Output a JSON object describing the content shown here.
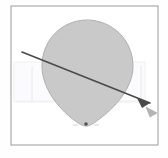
{
  "canvas": {
    "width": 168,
    "height": 158,
    "background_color": "#fefefe",
    "label": "shape-canvas"
  },
  "frame": {
    "label": "canvas-border-frame",
    "x": 11,
    "y": 6,
    "width": 147,
    "height": 139,
    "stroke_color": "#9a9a9a",
    "stroke_width": 1,
    "fill_color": "#ffffff"
  },
  "faint_overlay": {
    "label": "selection-overlay-rect",
    "x": 14,
    "y": 62,
    "width": 131,
    "height": 40,
    "fill_color": "#fbfbfd",
    "stroke_color": "#f0f0f5",
    "stroke_width": 1
  },
  "shape": {
    "label": "teardrop-balloon-shape",
    "type": "teardrop",
    "fill_color": "#c9c9c9",
    "stroke_color": "#b0b0b0",
    "stroke_width": 1,
    "bounds": {
      "left": 42,
      "top": 20,
      "right": 133,
      "bottom": 126
    },
    "center_x": 87,
    "top_y": 20,
    "tip_x": 86,
    "tip_y": 126,
    "path": "M 87 20 C 62 20 42 40 42 66 C 42 88 58 108 74 120 C 79 124 83 126 86 126 C 89 126 93 124 98 120 C 115 108 133 88 133 66 C 133 40 112 20 87 20 Z"
  },
  "arrow": {
    "label": "direction-arrow",
    "stroke_color": "#4a4a4a",
    "stroke_width": 1.6,
    "start_x": 22,
    "start_y": 52,
    "end_x": 150,
    "end_y": 103,
    "head_fill_color": "#4a4a4a",
    "head_points": "150,103 137,98 142,108"
  },
  "ghost_arrow": {
    "label": "ghost-arrowhead",
    "fill_color": "#b4b4b4",
    "stroke_color": "#a8a8a8",
    "points": "157,113 146,107 150,117"
  },
  "markers": [
    {
      "label": "bottom-anchor-point",
      "name": "anchor-point-bottom",
      "x": 86,
      "y": 124,
      "radius": 1.8,
      "color": "#555555"
    },
    {
      "label": "top-anchor-tick",
      "name": "anchor-point-top",
      "x": 88,
      "y": 20,
      "radius": 1.0,
      "color": "#d0d0d0"
    }
  ],
  "guides": [
    {
      "label": "left-guide-line",
      "name": "guide-line-left",
      "x1": 32,
      "y1": 66,
      "x2": 32,
      "y2": 100,
      "color": "#e8e8ee"
    },
    {
      "label": "right-guide-line",
      "name": "guide-line-right",
      "x1": 141,
      "y1": 66,
      "x2": 141,
      "y2": 100,
      "color": "#e8e8ee"
    },
    {
      "label": "center-guide-line",
      "name": "guide-line-center",
      "x1": 63,
      "y1": 72,
      "x2": 63,
      "y2": 100,
      "color": "#ececf2"
    },
    {
      "label": "baseline-guide",
      "name": "guide-line-baseline",
      "x1": 16,
      "y1": 101,
      "x2": 144,
      "y2": 101,
      "color": "#eeeef4"
    }
  ],
  "tick_marks": [
    {
      "name": "tick-bottom-left",
      "x1": 73,
      "y1": 125,
      "x2": 78,
      "y2": 125,
      "color": "#d4d4d4"
    },
    {
      "name": "tick-bottom-right",
      "x1": 94,
      "y1": 125,
      "x2": 99,
      "y2": 125,
      "color": "#d4d4d4"
    }
  ]
}
